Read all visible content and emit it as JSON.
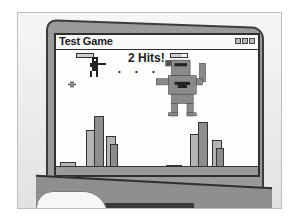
{
  "illustration": {
    "subject": "laptop-showing-game-window",
    "palette": {
      "background": "#f2f2f2",
      "laptop_body": "#9a9a9a",
      "outline": "#2f2f2f",
      "screen": "#fdfdfd",
      "building_dark": "#8d8d8d",
      "building_light": "#b4b4b4"
    }
  },
  "window": {
    "title": "Test Game",
    "controls": [
      "minimize-icon",
      "maximize-icon",
      "close-icon"
    ]
  },
  "game": {
    "hit_message": "2 Hits!",
    "projectile_dots": "• • •",
    "player": {
      "icon": "pixel-soldier-with-gun",
      "health_bar": "full"
    },
    "enemy": {
      "icon": "pixel-monster",
      "health_bar": "partial"
    },
    "skyline": "pixel-city-buildings"
  }
}
